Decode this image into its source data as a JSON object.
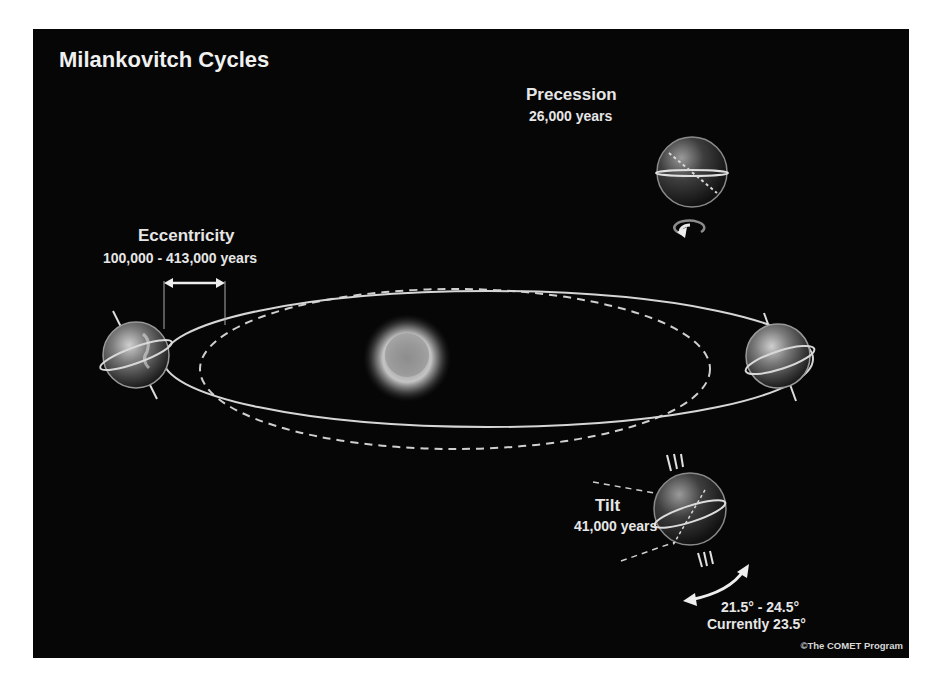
{
  "title": "Milankovitch Cycles",
  "cycles": {
    "precession": {
      "name": "Precession",
      "period": "26,000 years"
    },
    "eccentricity": {
      "name": "Eccentricity",
      "period": "100,000 - 413,000 years"
    },
    "tilt": {
      "name": "Tilt",
      "period": "41,000 years",
      "range": "21.5° - 24.5°",
      "current": "Currently 23.5°"
    }
  },
  "credit": "©The COMET Program",
  "colors": {
    "background": "#060606",
    "text": "#e6e6e6",
    "orbit_line": "#d0d0d0",
    "sun_core": "#bdbdbd"
  }
}
